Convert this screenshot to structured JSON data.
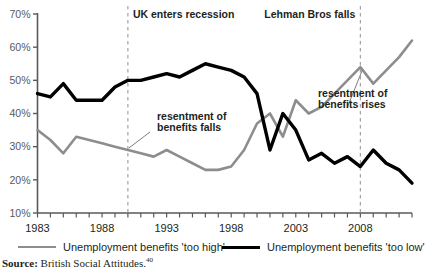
{
  "chart_data": {
    "type": "line",
    "title": "",
    "xlabel": "",
    "ylabel": "",
    "xlim": [
      1983,
      2012
    ],
    "ylim": [
      10,
      70
    ],
    "grid": false,
    "legend_position": "bottom",
    "y_ticks": [
      "10%",
      "20%",
      "30%",
      "40%",
      "50%",
      "60%",
      "70%"
    ],
    "y_tick_values": [
      10,
      20,
      30,
      40,
      50,
      60,
      70
    ],
    "x_tick_labels": [
      "1983",
      "1988",
      "1993",
      "1998",
      "2003",
      "2008"
    ],
    "x_tick_label_values": [
      1983,
      1988,
      1993,
      1998,
      2003,
      2008
    ],
    "x_minor_ticks": [
      1983,
      1984,
      1985,
      1986,
      1987,
      1988,
      1989,
      1990,
      1991,
      1992,
      1993,
      1994,
      1995,
      1996,
      1997,
      1998,
      1999,
      2000,
      2001,
      2002,
      2003,
      2004,
      2005,
      2006,
      2007,
      2008,
      2009,
      2010,
      2011,
      2012
    ],
    "x": [
      1983,
      1984,
      1985,
      1986,
      1987,
      1988,
      1989,
      1990,
      1991,
      1992,
      1993,
      1994,
      1995,
      1996,
      1997,
      1998,
      1999,
      2000,
      2001,
      2002,
      2003,
      2004,
      2005,
      2006,
      2007,
      2008,
      2009,
      2010,
      2011,
      2012
    ],
    "series": [
      {
        "name": "Unemployment benefits 'too high'",
        "color": "#8d8d8d",
        "width": 2.6,
        "values": [
          35,
          32,
          28,
          33,
          32,
          31,
          30,
          29,
          28,
          27,
          29,
          27,
          25,
          23,
          23,
          24,
          29,
          37,
          40,
          33,
          44,
          40,
          42,
          46,
          50,
          54,
          49,
          53,
          57,
          62
        ]
      },
      {
        "name": "Unemployment benefits 'too low'",
        "color": "#000000",
        "width": 3.4,
        "values": [
          46,
          45,
          49,
          44,
          44,
          44,
          48,
          50,
          50,
          51,
          52,
          51,
          53,
          55,
          54,
          53,
          51,
          46,
          29,
          40,
          35,
          26,
          28,
          25,
          27,
          24,
          29,
          25,
          23,
          19
        ]
      }
    ],
    "event_lines": [
      {
        "label": "UK enters recession",
        "year": 1990,
        "label_side": "right"
      },
      {
        "label": "Lehman Bros falls",
        "year": 2008,
        "label_side": "left"
      }
    ],
    "annotations": [
      {
        "text_line1": "resentment of",
        "text_line2": "benefits falls",
        "target_year": 1990,
        "target_value": 29
      },
      {
        "text_line1": "resentment of",
        "text_line2": "benefits rises",
        "target_year": 2008,
        "target_value": 54
      }
    ]
  },
  "legend": {
    "items": [
      {
        "label": "Unemployment benefits 'too high'",
        "style": "grey"
      },
      {
        "label": "Unemployment benefits 'too low'",
        "style": "black"
      }
    ]
  },
  "source": {
    "label": "Source:",
    "text": " British Social Attitudes.",
    "note": "40"
  }
}
